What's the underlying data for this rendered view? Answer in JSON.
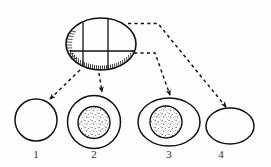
{
  "figure": {
    "type": "line-drawing-diagram",
    "background_color": "#fefefe",
    "ink_color": "#1a1a1a",
    "source_object": {
      "name": "hatched-ellipse",
      "shape": "ellipse",
      "cx": 101,
      "cy": 44,
      "rx": 35,
      "ry": 26,
      "internal_lines": {
        "horizontal": {
          "y": 51,
          "x1": 70,
          "x2": 134
        },
        "vertical_left": {
          "x": 83,
          "y1": 22,
          "y2": 67
        },
        "vertical_right": {
          "x": 108,
          "y1": 19,
          "y2": 70
        }
      },
      "hatching": {
        "regions": [
          "bottom-arc-interior",
          "left-arc-interior"
        ],
        "style": "short radial tick marks"
      }
    },
    "arrows": [
      {
        "id": "arrow-to-1",
        "from": "hatched-ellipse",
        "to": "shape-1",
        "style": "dashed",
        "arrowhead": "solid-triangle",
        "path": "M 80 70 L 50 99"
      },
      {
        "id": "arrow-to-2",
        "from": "hatched-ellipse",
        "to": "shape-2",
        "style": "dashed",
        "arrowhead": "solid-triangle",
        "path": "M 99 73 L 102 93"
      },
      {
        "id": "arrow-to-3",
        "from": "hatched-ellipse",
        "to": "shape-3",
        "style": "dashed",
        "arrowhead": "solid-triangle",
        "path": "M 134 53 L 155 53 L 170 96"
      },
      {
        "id": "arrow-to-4",
        "from": "hatched-ellipse",
        "to": "shape-4",
        "style": "dashed",
        "arrowhead": "solid-triangle",
        "path": "M 128 24 L 158 24 L 226 108"
      }
    ],
    "shapes": [
      {
        "id": "shape-1",
        "label": "1",
        "outline": "circle",
        "cx": 36,
        "cy": 120,
        "rx": 21,
        "ry": 21,
        "inner_fill": "none",
        "has_inner_body": false,
        "label_x": 36,
        "label_y": 154
      },
      {
        "id": "shape-2",
        "label": "2",
        "outline": "circle",
        "cx": 94,
        "cy": 122,
        "rx": 27,
        "ry": 26,
        "inner_fill": "stipple",
        "has_inner_body": true,
        "inner": {
          "cx": 94,
          "cy": 123,
          "rx": 16,
          "ry": 16
        },
        "label_x": 94,
        "label_y": 154
      },
      {
        "id": "shape-3",
        "label": "3",
        "outline": "ellipse",
        "cx": 169,
        "cy": 122,
        "rx": 31,
        "ry": 24,
        "inner_fill": "stipple",
        "has_inner_body": true,
        "inner": {
          "cx": 166,
          "cy": 122,
          "rx": 16,
          "ry": 16
        },
        "label_x": 169,
        "label_y": 154
      },
      {
        "id": "shape-4",
        "label": "4",
        "outline": "ellipse",
        "cx": 230,
        "cy": 126,
        "rx": 24,
        "ry": 18,
        "inner_fill": "none",
        "has_inner_body": false,
        "label_x": 230,
        "label_y": 154
      }
    ],
    "labels": {
      "item_1": "1",
      "item_2": "2",
      "item_3": "3",
      "item_4": "4"
    }
  }
}
